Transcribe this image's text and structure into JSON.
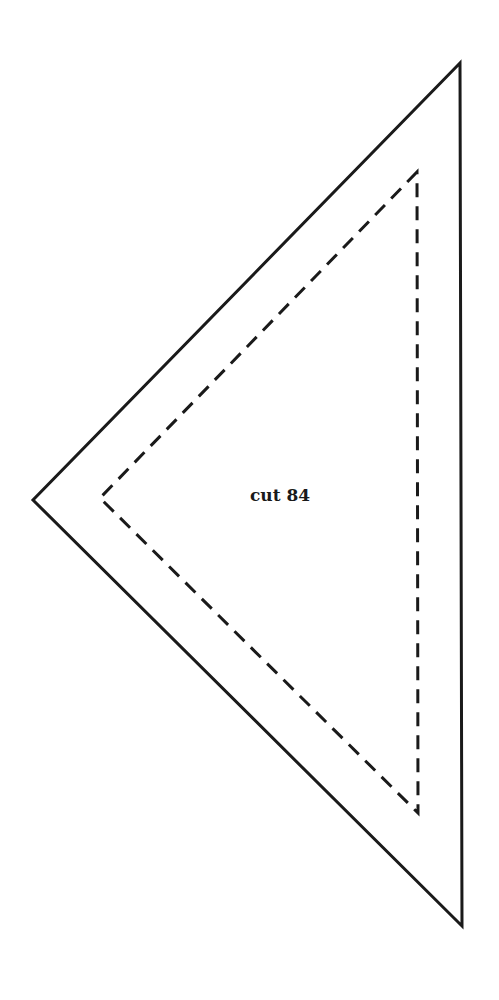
{
  "pattern": {
    "label": "cut 84",
    "stroke_color": "#1a1a1a",
    "outer_triangle": {
      "style": "solid",
      "points": [
        [
          460,
          63
        ],
        [
          33,
          500
        ],
        [
          462,
          926
        ]
      ]
    },
    "inner_triangle": {
      "style": "dashed",
      "points": [
        [
          417,
          172
        ],
        [
          100,
          498
        ],
        [
          418,
          813
        ]
      ]
    }
  }
}
